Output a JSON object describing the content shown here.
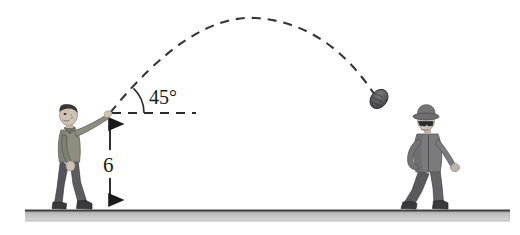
{
  "figure": {
    "background_color": "#ffffff"
  },
  "labels": {
    "angle": "45°",
    "height": "6"
  },
  "colors": {
    "ink": "#1a1a1a",
    "trajectory": "#3a3a4a",
    "ground_fill": "#b0b0b0",
    "ground_edge": "#4a4a4a",
    "skin": "#cfc3b6",
    "skin_shadow": "#a79a8c",
    "hair": "#3a3632",
    "shirt": "#8e8d80",
    "shirt_shadow": "#6f6e63",
    "pants": "#5d5d5f",
    "pants_shadow": "#464648",
    "shoes": "#3d3d40",
    "jacket": "#7b7b7d",
    "jacket_shadow": "#5e5e60",
    "hat": "#757577",
    "glasses": "#2b2b2e",
    "ball": "#4e4e50"
  },
  "geometry": {
    "launch_point": {
      "x": 110,
      "y": 113
    },
    "apex": {
      "x": 256,
      "y": 18
    },
    "ball_position": {
      "x": 378,
      "y": 100
    },
    "ground_y": 210,
    "ground_x_start": 25,
    "ground_x_end": 510,
    "horizontal_dash_x_end": 196,
    "angle_arc_radius": 34,
    "height_arrow_x": 110,
    "height_arrow_top_y": 115,
    "height_arrow_bottom_y": 209
  },
  "elements": {
    "thrower_name": "thrower-figure",
    "catcher_name": "catcher-figure",
    "ball_name": "ball",
    "trajectory_name": "trajectory-path",
    "ground_name": "ground-line"
  }
}
